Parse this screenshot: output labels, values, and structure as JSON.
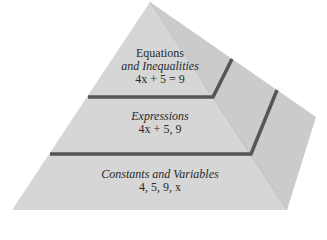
{
  "diagram": {
    "type": "pyramid",
    "colors": {
      "front_face": "#d6d6d6",
      "right_face": "#cacaca",
      "ledge": "#555555",
      "text": "#2a2a2a"
    },
    "tiers": [
      {
        "level": "top",
        "title_line1": "Equations",
        "title_line2": "and Inequalities",
        "example": "4x + 5 = 9"
      },
      {
        "level": "middle",
        "title": "Expressions",
        "example": "4x + 5, 9"
      },
      {
        "level": "bottom",
        "title": "Constants and Variables",
        "example": "4, 5, 9, x"
      }
    ]
  }
}
